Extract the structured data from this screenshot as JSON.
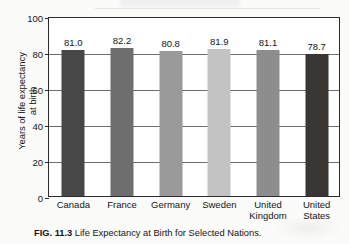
{
  "chart_data": {
    "type": "bar",
    "title": "",
    "xlabel": "",
    "ylabel": "Years of life expectancy\nat birth",
    "ylim": [
      0,
      100
    ],
    "yticks": [
      0,
      20,
      40,
      60,
      80,
      100
    ],
    "ytick_labels": [
      "0",
      "20",
      "40",
      "60",
      "80",
      "100"
    ],
    "grid": true,
    "legend": "none",
    "categories": [
      "Canada",
      "France",
      "Germany",
      "Sweden",
      "United\nKingdom",
      "United\nStates"
    ],
    "values": [
      81.0,
      82.2,
      80.8,
      81.9,
      81.1,
      78.7
    ],
    "value_labels": [
      "81.0",
      "82.2",
      "80.8",
      "81.9",
      "81.1",
      "78.7"
    ],
    "bar_colors": [
      "#474747",
      "#6e6e6e",
      "#9a9a9a",
      "#c3c3c3",
      "#8d8d8d",
      "#3a3634"
    ]
  },
  "caption": {
    "figure_number": "FIG. 11.3",
    "text": "Life Expectancy at Birth for Selected Nations."
  }
}
